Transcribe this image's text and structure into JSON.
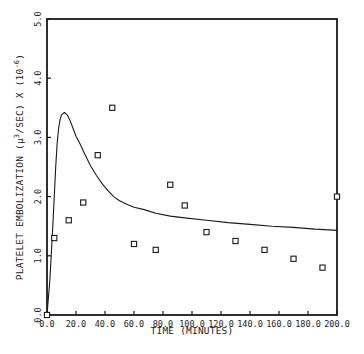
{
  "chart_data": {
    "type": "scatter",
    "title": "",
    "xlabel": "TIME (MINUTES)",
    "ylabel": "PLATELET EMBOLIZATION (μ³/SEC) X (10⁻⁶)",
    "xlim": [
      0,
      200
    ],
    "ylim": [
      0,
      5
    ],
    "x_ticks": [
      0,
      20,
      40,
      60,
      80,
      100,
      120,
      140,
      160,
      180,
      200
    ],
    "x_tick_labels": [
      "0.0",
      "20.0",
      "40.0",
      "60.0",
      "80.0",
      "100.0",
      "120.0",
      "140.0",
      "160.0",
      "180.0",
      "200.0"
    ],
    "y_ticks": [
      0,
      1,
      2,
      3,
      4,
      5
    ],
    "y_tick_labels": [
      "0.0",
      "1.0",
      "2.0",
      "3.0",
      "4.0",
      "5.0"
    ],
    "grid": false,
    "legend": null,
    "series": [
      {
        "name": "observed",
        "kind": "scatter",
        "marker": "square-open",
        "points": [
          [
            0,
            0.0
          ],
          [
            5,
            1.3
          ],
          [
            15,
            1.6
          ],
          [
            25,
            1.9
          ],
          [
            35,
            2.7
          ],
          [
            45,
            3.5
          ],
          [
            60,
            1.2
          ],
          [
            75,
            1.1
          ],
          [
            85,
            2.2
          ],
          [
            95,
            1.85
          ],
          [
            110,
            1.4
          ],
          [
            130,
            1.25
          ],
          [
            150,
            1.1
          ],
          [
            170,
            0.95
          ],
          [
            190,
            0.8
          ],
          [
            200,
            2.0
          ]
        ]
      },
      {
        "name": "model fit",
        "kind": "line",
        "points": [
          [
            0,
            0.0
          ],
          [
            2,
            0.6
          ],
          [
            4,
            1.5
          ],
          [
            5,
            2.0
          ],
          [
            6,
            2.5
          ],
          [
            7,
            2.9
          ],
          [
            8,
            3.15
          ],
          [
            9,
            3.3
          ],
          [
            10,
            3.38
          ],
          [
            12,
            3.42
          ],
          [
            14,
            3.38
          ],
          [
            16,
            3.28
          ],
          [
            18,
            3.15
          ],
          [
            20,
            3.02
          ],
          [
            23,
            2.88
          ],
          [
            26,
            2.72
          ],
          [
            30,
            2.52
          ],
          [
            34,
            2.36
          ],
          [
            38,
            2.22
          ],
          [
            42,
            2.1
          ],
          [
            46,
            2.0
          ],
          [
            50,
            1.93
          ],
          [
            55,
            1.87
          ],
          [
            60,
            1.82
          ],
          [
            67,
            1.78
          ],
          [
            75,
            1.72
          ],
          [
            85,
            1.67
          ],
          [
            95,
            1.64
          ],
          [
            110,
            1.6
          ],
          [
            125,
            1.56
          ],
          [
            140,
            1.53
          ],
          [
            155,
            1.5
          ],
          [
            170,
            1.48
          ],
          [
            185,
            1.45
          ],
          [
            200,
            1.43
          ]
        ]
      }
    ]
  },
  "plot_area": {
    "left": 47,
    "top": 19,
    "right": 337,
    "bottom": 315
  },
  "colors": {
    "ink": "#1a1a1a",
    "background": "#ffffff"
  }
}
